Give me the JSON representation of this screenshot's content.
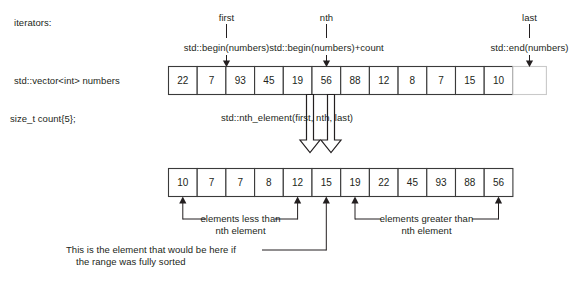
{
  "diagram": {
    "title_hint": "std::nth_element illustration",
    "left_labels": {
      "iterators": "iterators:",
      "vector_decl": "std::vector<int> numbers",
      "count_decl": "size_t count{5};"
    },
    "iterator_markers": [
      {
        "name": "first",
        "expr": "std::begin(numbers)",
        "target_index": 0
      },
      {
        "name": "nth",
        "expr": "std::begin(numbers)+count",
        "target_index": 5
      },
      {
        "name": "last",
        "expr": "std::end(numbers)",
        "target_index": 12
      }
    ],
    "before_array": {
      "values": [
        "22",
        "7",
        "93",
        "45",
        "19",
        "56",
        "88",
        "12",
        "8",
        "7",
        "15",
        "10"
      ],
      "past_the_end_cell": true
    },
    "operation_label": "std::nth_element(first, nth, last)",
    "after_array": {
      "values": [
        "10",
        "7",
        "7",
        "8",
        "12",
        "15",
        "19",
        "22",
        "45",
        "93",
        "88",
        "56"
      ],
      "nth_position_index": 5
    },
    "brackets": [
      {
        "label_line1": "elements less than",
        "label_line2": "nth element",
        "start_index": 0,
        "end_index": 4
      },
      {
        "label_line1": "elements greater than",
        "label_line2": "nth element",
        "start_index": 6,
        "end_index": 11
      }
    ],
    "callout": {
      "line1": "This is the element that would be here if",
      "line2": "the range was fully sorted",
      "points_to_index": 5
    },
    "colors": {
      "ink": "#231f20",
      "cell_border": "#3a3a3a",
      "ghost_border": "#c9c9c9",
      "background": "#ffffff"
    }
  }
}
